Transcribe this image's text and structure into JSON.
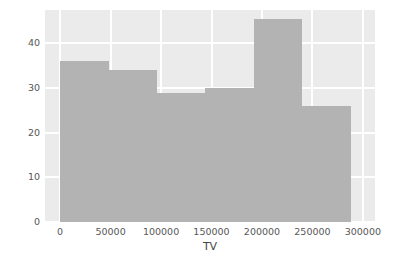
{
  "chart_data": {
    "type": "bar",
    "subtype": "histogram",
    "title": "",
    "xlabel": "TV",
    "ylabel": "",
    "xlim": [
      -15000,
      312000
    ],
    "ylim": [
      0,
      47.5
    ],
    "grid": true,
    "legend": null,
    "bar_color": "#b2b2b2",
    "plot_background": "#ebebeb",
    "gridline_color": "#ffffff",
    "figure_background": "#ffffff",
    "bin_edges": [
      0,
      48000,
      96000,
      144000,
      192000,
      240000,
      288000
    ],
    "categories": [
      "0-48000",
      "48000-96000",
      "96000-144000",
      "144000-192000",
      "192000-240000",
      "240000-288000"
    ],
    "values": [
      36,
      34,
      29,
      30,
      45.5,
      26
    ],
    "xticks": [
      {
        "value": 0,
        "label": "0"
      },
      {
        "value": 50000,
        "label": "50000"
      },
      {
        "value": 100000,
        "label": "100000"
      },
      {
        "value": 150000,
        "label": "150000"
      },
      {
        "value": 200000,
        "label": "200000"
      },
      {
        "value": 250000,
        "label": "250000"
      },
      {
        "value": 300000,
        "label": "300000"
      }
    ],
    "yticks": [
      {
        "value": 0,
        "label": "0"
      },
      {
        "value": 10,
        "label": "10"
      },
      {
        "value": 20,
        "label": "20"
      },
      {
        "value": 30,
        "label": "30"
      },
      {
        "value": 40,
        "label": "40"
      }
    ]
  }
}
